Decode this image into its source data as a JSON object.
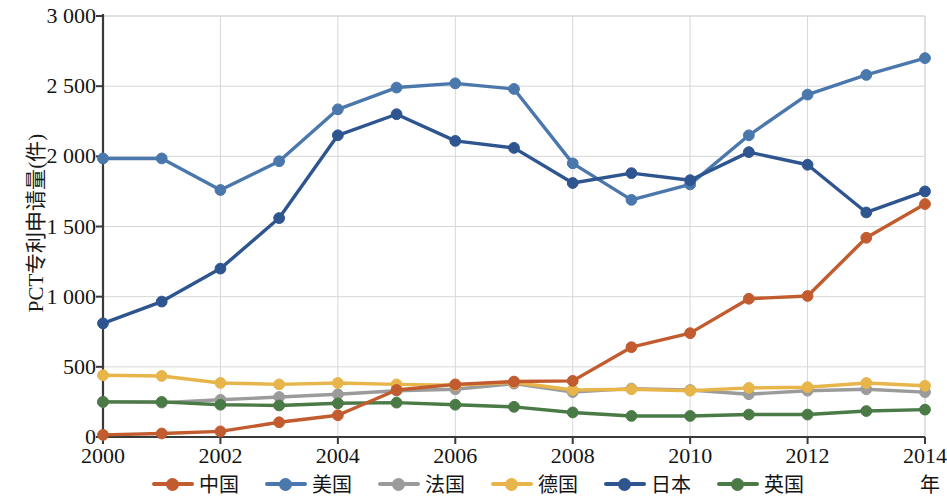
{
  "chart_data": {
    "type": "line",
    "title": "",
    "xlabel": "年",
    "ylabel": "PCT专利申请量(件)",
    "x": [
      2000,
      2001,
      2002,
      2003,
      2004,
      2005,
      2006,
      2007,
      2008,
      2009,
      2010,
      2011,
      2012,
      2013,
      2014
    ],
    "xlim": [
      2000,
      2014
    ],
    "ylim": [
      0,
      3000
    ],
    "xticks": [
      "2000",
      "2002",
      "2004",
      "2006",
      "2008",
      "2010",
      "2012",
      "2014"
    ],
    "xtick_values": [
      2000,
      2002,
      2004,
      2006,
      2008,
      2010,
      2012,
      2014
    ],
    "yticks": [
      "0",
      "500",
      "1 000",
      "1 500",
      "2 000",
      "2 500",
      "3 000"
    ],
    "ytick_values": [
      0,
      500,
      1000,
      1500,
      2000,
      2500,
      3000
    ],
    "grid": true,
    "legend_position": "bottom",
    "series": [
      {
        "name": "中国",
        "color": "#C25B2E",
        "values": [
          15,
          25,
          40,
          105,
          155,
          335,
          375,
          395,
          400,
          640,
          740,
          985,
          1005,
          1420,
          1660
        ]
      },
      {
        "name": "美国",
        "color": "#4A77AC",
        "values": [
          1985,
          1985,
          1760,
          1965,
          2335,
          2490,
          2520,
          2480,
          1950,
          1690,
          1800,
          2150,
          2440,
          2580,
          2700
        ]
      },
      {
        "name": "法国",
        "color": "#9B9B9B",
        "values": [
          250,
          245,
          265,
          285,
          305,
          330,
          340,
          380,
          320,
          345,
          335,
          305,
          330,
          340,
          320
        ]
      },
      {
        "name": "德国",
        "color": "#E7B54A",
        "values": [
          440,
          435,
          385,
          375,
          385,
          375,
          370,
          390,
          335,
          340,
          330,
          350,
          355,
          385,
          365
        ]
      },
      {
        "name": "日本",
        "color": "#2E558F",
        "values": [
          810,
          965,
          1200,
          1560,
          2150,
          2300,
          2110,
          2060,
          1810,
          1880,
          1830,
          2030,
          1940,
          1600,
          1750
        ]
      },
      {
        "name": "英国",
        "color": "#4A7A45",
        "values": [
          250,
          250,
          230,
          225,
          240,
          245,
          230,
          215,
          175,
          150,
          150,
          160,
          160,
          185,
          195
        ]
      }
    ]
  },
  "axes": {
    "y_axis_label": "PCT专利申请量(件)",
    "x_axis_label": "年"
  }
}
